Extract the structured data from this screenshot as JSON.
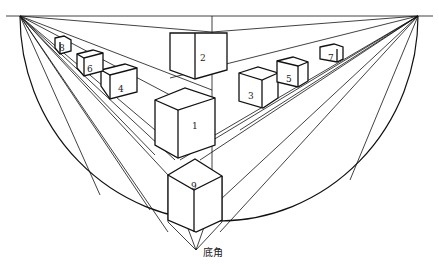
{
  "diagram": {
    "type": "three-point perspective construction",
    "horizon_line": true,
    "vanishing_points": [
      "left",
      "right",
      "bottom"
    ],
    "cube_labels": [
      "1",
      "2",
      "3",
      "4",
      "5",
      "6",
      "7",
      "8",
      "9"
    ],
    "bottom_label": "底角"
  }
}
